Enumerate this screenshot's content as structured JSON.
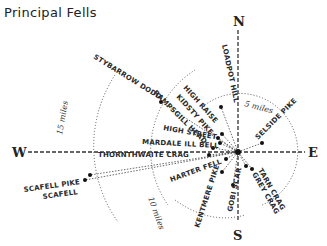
{
  "title": "Principal Fells",
  "compass": {
    "north": "N",
    "south": "S",
    "east": "E",
    "west": "W"
  },
  "rings": [
    {
      "label": "5 miles"
    },
    {
      "label": "10 miles"
    },
    {
      "label": "15 miles"
    }
  ],
  "fells": [
    {
      "name": "LOADPOT HILL"
    },
    {
      "name": "STYBARROW DODD"
    },
    {
      "name": "HIGH RAISE"
    },
    {
      "name": "KIDSTY PIKE"
    },
    {
      "name": "RAMPSGILL HEAD"
    },
    {
      "name": "HIGH STREET"
    },
    {
      "name": "MARDALE ILL BELL"
    },
    {
      "name": "THORNTHWAITE CRAG"
    },
    {
      "name": "HARTER FELL"
    },
    {
      "name": "KENTMERE PIKE"
    },
    {
      "name": "GOBI SCAR"
    },
    {
      "name": "GREY CRAG"
    },
    {
      "name": "TARN CRAG"
    },
    {
      "name": "SELSIDE PIKE"
    },
    {
      "name": "SCAFELL PIKE"
    },
    {
      "name": "SCAFELL"
    }
  ]
}
